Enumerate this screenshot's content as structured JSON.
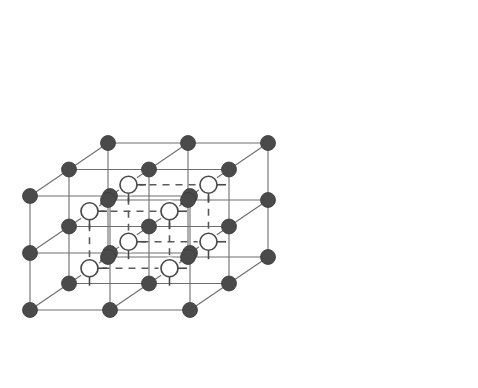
{
  "figure": {
    "title": "Cubic crystal lattice unit cell diagram",
    "background_color": "#ffffff"
  },
  "style": {
    "solid_edge_color": "#6e6e6e",
    "dashed_edge_color": "#5a5a5a",
    "filled_atom_color": "#4a4a4a",
    "filled_atom_stroke": "#3a3a3a",
    "open_atom_fill": "#ffffff",
    "open_atom_stroke": "#4a4a4a",
    "solid_edge_width": 1.1,
    "dashed_edge_width": 1.6,
    "dash_pattern": "7,6",
    "filled_atom_radius": 7.5,
    "open_atom_radius": 8.5,
    "stub_length": 9
  },
  "projection": {
    "origin_x": 30,
    "origin_y": 310,
    "step_x": 160,
    "step_y": -114,
    "depth_dx": 78,
    "depth_dy": -53,
    "divisions": 2,
    "note": "Oblique (cabinet-style) projection; integer lattice coords i,j,k each range 0..2."
  },
  "atoms": {
    "filled": {
      "label": "lattice-atom-filled",
      "count": 27,
      "element_role": "cation-site",
      "coords": [
        [
          0,
          0,
          0
        ],
        [
          1,
          0,
          0
        ],
        [
          2,
          0,
          0
        ],
        [
          0,
          1,
          0
        ],
        [
          1,
          1,
          0
        ],
        [
          2,
          1,
          0
        ],
        [
          0,
          2,
          0
        ],
        [
          1,
          2,
          0
        ],
        [
          2,
          2,
          0
        ],
        [
          0,
          0,
          1
        ],
        [
          1,
          0,
          1
        ],
        [
          2,
          0,
          1
        ],
        [
          0,
          1,
          1
        ],
        [
          1,
          1,
          1
        ],
        [
          2,
          1,
          1
        ],
        [
          0,
          2,
          1
        ],
        [
          1,
          2,
          1
        ],
        [
          2,
          2,
          1
        ],
        [
          0,
          0,
          2
        ],
        [
          1,
          0,
          2
        ],
        [
          2,
          0,
          2
        ],
        [
          0,
          1,
          2
        ],
        [
          1,
          1,
          2
        ],
        [
          2,
          1,
          2
        ],
        [
          0,
          2,
          2
        ],
        [
          1,
          2,
          2
        ],
        [
          2,
          2,
          2
        ]
      ]
    },
    "open": {
      "label": "interstitial-atom-open",
      "count": 8,
      "element_role": "anion-site",
      "coords": [
        [
          0.5,
          0.5,
          0.5
        ],
        [
          1.5,
          0.5,
          0.5
        ],
        [
          0.5,
          1.5,
          0.5
        ],
        [
          1.5,
          1.5,
          0.5
        ],
        [
          0.5,
          0.5,
          1.5
        ],
        [
          1.5,
          0.5,
          1.5
        ],
        [
          0.5,
          1.5,
          1.5
        ],
        [
          1.5,
          1.5,
          1.5
        ]
      ],
      "stub_directions": [
        "right",
        "down"
      ]
    }
  },
  "edges": {
    "solid": {
      "label": "lattice-edge-solid",
      "description": "Grid lines joining filled lattice atoms along the three cube axes across all layers."
    },
    "dashed": {
      "label": "inner-cube-edge-dashed",
      "description": "Twelve dashed edges outlining the inner cube whose corners are the open interstitial atoms."
    }
  },
  "legend": {
    "filled_meaning": "filled circle = lattice atom",
    "open_meaning": "open circle = interstitial atom"
  }
}
